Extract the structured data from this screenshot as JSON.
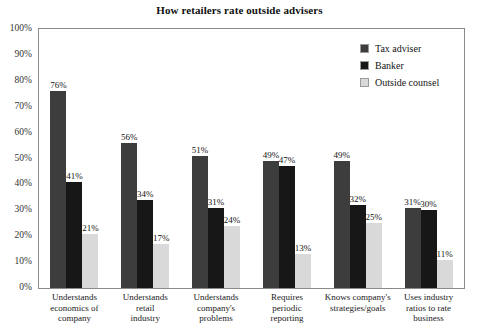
{
  "chart_data": {
    "type": "bar",
    "title": "How retailers rate outside advisers",
    "xlabel": "",
    "ylabel": "",
    "ylim": [
      0,
      100
    ],
    "ytick_labels": [
      "0%",
      "10%",
      "20%",
      "30%",
      "40%",
      "50%",
      "60%",
      "70%",
      "80%",
      "90%",
      "100%"
    ],
    "ytick_values": [
      0,
      10,
      20,
      30,
      40,
      50,
      60,
      70,
      80,
      90,
      100
    ],
    "grid": false,
    "legend_position": "top-right",
    "value_suffix": "%",
    "categories": [
      "Understands economics of company",
      "Understands retail industry",
      "Understands company's problems",
      "Requires periodic reporting",
      "Knows company's strategies/goals",
      "Uses industry ratios to rate business"
    ],
    "category_lines": [
      [
        "Understands",
        "economics of",
        "company"
      ],
      [
        "Understands",
        "retail",
        "industry"
      ],
      [
        "Understands",
        "company's",
        "problems"
      ],
      [
        "Requires",
        "periodic",
        "reporting"
      ],
      [
        "Knows company's",
        "strategies/goals"
      ],
      [
        "Uses industry",
        "ratios to rate",
        "business"
      ]
    ],
    "series": [
      {
        "name": "Tax adviser",
        "color": "#3d3d3d",
        "values": [
          76,
          56,
          51,
          49,
          49,
          31
        ],
        "labels": [
          "76%",
          "56%",
          "51%",
          "49%",
          "49%",
          "31%"
        ]
      },
      {
        "name": "Banker",
        "color": "#171717",
        "values": [
          41,
          34,
          31,
          47,
          32,
          30
        ],
        "labels": [
          "41%",
          "34%",
          "31%",
          "47%",
          "32%",
          "30%"
        ]
      },
      {
        "name": "Outside counsel",
        "color": "#d9d9d9",
        "values": [
          21,
          17,
          24,
          13,
          25,
          11
        ],
        "labels": [
          "21%",
          "17%",
          "24%",
          "13%",
          "25%",
          "11%"
        ]
      }
    ]
  },
  "legend": {
    "items": [
      {
        "label": "Tax adviser",
        "color": "#3d3d3d"
      },
      {
        "label": "Banker",
        "color": "#171717"
      },
      {
        "label": "Outside counsel",
        "color": "#d9d9d9"
      }
    ]
  }
}
